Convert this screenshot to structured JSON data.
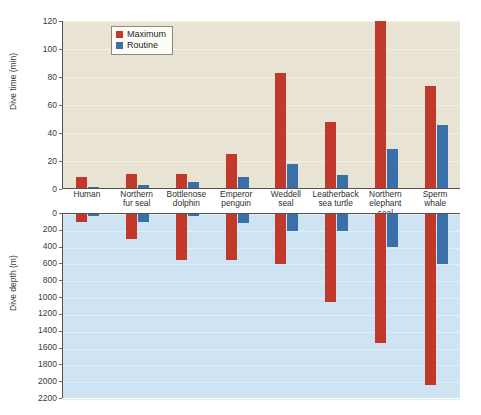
{
  "chart_data": [
    {
      "type": "bar",
      "id": "dive-time",
      "title": "",
      "xlabel": "",
      "ylabel": "Dive time (min)",
      "ylim": [
        0,
        120
      ],
      "yticks": [
        0,
        20,
        40,
        60,
        80,
        100,
        120
      ],
      "grid": true,
      "legend": [
        "Maximum",
        "Routine"
      ],
      "legend_position": "top-left-inside",
      "categories": [
        "Human",
        "Northern fur seal",
        "Bottlenose dolphin",
        "Emperor penguin",
        "Weddell seal",
        "Leatherback sea turtle",
        "Northern elephant seal",
        "Sperm whale"
      ],
      "series": [
        {
          "name": "Maximum",
          "color": "#c0392b",
          "values": [
            8,
            10,
            10,
            24,
            82,
            47,
            119,
            73
          ]
        },
        {
          "name": "Routine",
          "color": "#3b6fa8",
          "values": [
            1,
            2,
            4,
            8,
            17,
            9,
            28,
            45
          ]
        }
      ]
    },
    {
      "type": "bar",
      "id": "dive-depth",
      "title": "",
      "xlabel": "",
      "ylabel": "Dive depth (m)",
      "ylim": [
        0,
        2200
      ],
      "yticks": [
        0,
        200,
        400,
        600,
        800,
        1000,
        1200,
        1400,
        1600,
        1800,
        2000,
        2200
      ],
      "grid": true,
      "direction": "downward",
      "categories": [
        "Human",
        "Northern fur seal",
        "Bottlenose dolphin",
        "Emperor penguin",
        "Weddell seal",
        "Leatherback sea turtle",
        "Northern elephant seal",
        "Sperm whale"
      ],
      "series": [
        {
          "name": "Maximum",
          "color": "#c0392b",
          "values": [
            100,
            300,
            545,
            545,
            600,
            1050,
            1530,
            2035
          ]
        },
        {
          "name": "Routine",
          "color": "#3b6fa8",
          "values": [
            10,
            100,
            10,
            110,
            200,
            200,
            390,
            600
          ]
        }
      ]
    }
  ],
  "categories_wrapped": [
    [
      "Human",
      ""
    ],
    [
      "Northern",
      "fur seal"
    ],
    [
      "Bottlenose",
      "dolphin"
    ],
    [
      "Emperor",
      "penguin"
    ],
    [
      "Weddell",
      "seal"
    ],
    [
      "Leatherback",
      "sea turtle"
    ],
    [
      "Northern",
      "elephant seal"
    ],
    [
      "Sperm",
      "whale"
    ]
  ],
  "colors": {
    "maximum": "#c0392b",
    "routine": "#3b6fa8",
    "time_panel_bg": "#e8e3d2",
    "depth_panel_bg": "#cfe4f2",
    "axis": "#55524c",
    "page_bg": "#ffffff"
  },
  "legend": {
    "maximum_label": "Maximum",
    "routine_label": "Routine"
  }
}
